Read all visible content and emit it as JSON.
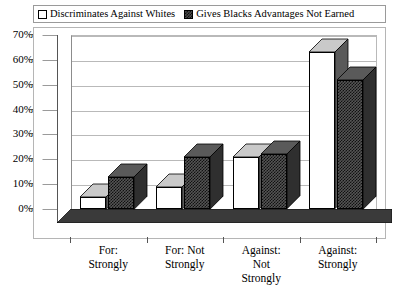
{
  "legend": {
    "position": "top",
    "entries": [
      {
        "label": "Discriminates Against Whites",
        "swatch": "white-square-icon"
      },
      {
        "label": "Gives Blacks Advantages Not Earned",
        "swatch": "hatched-square-icon"
      }
    ]
  },
  "chart_data": {
    "type": "bar",
    "title": "",
    "subtitle": "",
    "xlabel": "",
    "ylabel": "",
    "ylim": [
      0,
      70
    ],
    "grid": true,
    "legend_position": "top",
    "categories": [
      "For: Strongly",
      "For: Not Strongly",
      "Against: Not Strongly",
      "Against: Strongly"
    ],
    "category_lines": [
      [
        "For:",
        "Strongly"
      ],
      [
        "For: Not",
        "Strongly"
      ],
      [
        "Against:",
        "Not",
        "Strongly"
      ],
      [
        "Against:",
        "Strongly"
      ]
    ],
    "ytick_labels": [
      "0%",
      "10%",
      "20%",
      "30%",
      "40%",
      "50%",
      "60%",
      "70%"
    ],
    "ytick_values": [
      0,
      10,
      20,
      30,
      40,
      50,
      60,
      70
    ],
    "series": [
      {
        "name": "Discriminates Against Whites",
        "values": [
          5,
          9,
          21,
          63
        ],
        "fill": "white",
        "color": "#ffffff"
      },
      {
        "name": "Gives Blacks Advantages Not Earned",
        "values": [
          13,
          21,
          22,
          52
        ],
        "fill": "hatched",
        "color": "#4a4a4a"
      }
    ]
  },
  "axes": {
    "y": {
      "min": 0,
      "max": 70,
      "step": 10,
      "unit": "%"
    }
  }
}
